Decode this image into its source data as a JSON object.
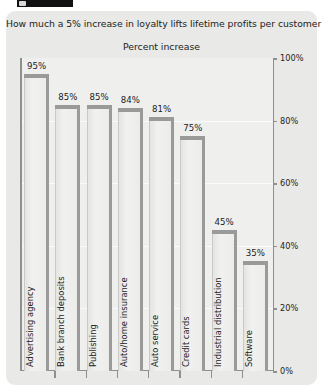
{
  "figure": {
    "title": "How much a 5% increase in loyalty lifts lifetime profits per customer",
    "subtitle": "Percent increase",
    "panel_color": "#e9e9e7",
    "plot_color": "#efefed",
    "bar_fill": "#ececeb",
    "bar_shadow": "#9a9a9a",
    "axis_color": "#8f8f8f"
  },
  "chart_data": {
    "type": "bar",
    "title": "How much a 5% increase in loyalty lifts lifetime profits per customer",
    "subtitle": "Percent increase",
    "xlabel": "",
    "ylabel": "Percent increase",
    "ylim": [
      0,
      100
    ],
    "yticks": [
      0,
      20,
      40,
      60,
      80,
      100
    ],
    "ytick_labels": [
      "0%",
      "20%",
      "40%",
      "60%",
      "80%",
      "100%"
    ],
    "grid": true,
    "legend": "none",
    "orientation": "vertical",
    "categories": [
      "Advertising agency",
      "Bank branch deposits",
      "Publishing",
      "Auto/home insurance",
      "Auto service",
      "Credit cards",
      "Industrial distribution",
      "Software"
    ],
    "values": [
      95,
      85,
      85,
      84,
      81,
      75,
      45,
      35
    ],
    "value_labels": [
      "95%",
      "85%",
      "85%",
      "84%",
      "81%",
      "75%",
      "45%",
      "35%"
    ]
  }
}
